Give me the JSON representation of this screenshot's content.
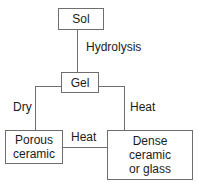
{
  "diagram": {
    "background_color": "#ffffff",
    "line_color": "#6e6e6e",
    "text_color": "#1a1a1a",
    "nodes": [
      {
        "id": "sol",
        "label": "Sol"
      },
      {
        "id": "gel",
        "label": "Gel"
      },
      {
        "id": "porous_ceramic",
        "label": "Porous\nceramic"
      },
      {
        "id": "dense_ceramic",
        "label": "Dense\nceramic\nor glass"
      }
    ],
    "edge_labels": [
      {
        "id": "hydrolysis",
        "label": "Hydrolysis"
      },
      {
        "id": "dry",
        "label": "Dry"
      },
      {
        "id": "heat_right",
        "label": "Heat"
      },
      {
        "id": "heat_bottom",
        "label": "Heat"
      }
    ],
    "edges": [
      {
        "from": "sol",
        "to": "gel",
        "label": "Hydrolysis"
      },
      {
        "from": "gel",
        "to": "porous_ceramic",
        "label": "Dry"
      },
      {
        "from": "gel",
        "to": "dense_ceramic",
        "label": "Heat"
      },
      {
        "from": "porous_ceramic",
        "to": "dense_ceramic",
        "label": "Heat"
      }
    ]
  }
}
